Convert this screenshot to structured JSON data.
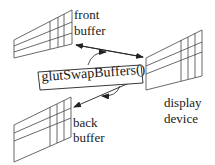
{
  "diagram": {
    "type": "double-buffering",
    "nodes": {
      "front_buffer": {
        "label_line1": "front",
        "label_line2": "buffer"
      },
      "back_buffer": {
        "label_line1": "back",
        "label_line2": "buffer"
      },
      "display_device": {
        "label_line1": "display",
        "label_line2": "device"
      }
    },
    "function_label": "glutSwapBuffers()",
    "edges": [
      {
        "from": "display_device",
        "to": "front_buffer",
        "bidirectional": true
      },
      {
        "from": "display_device",
        "to": "back_buffer",
        "bidirectional": true
      },
      {
        "from": "front_buffer",
        "to": "back_buffer",
        "kind": "circular-swap"
      }
    ],
    "colors": {
      "stroke": "#333333",
      "text": "#1a1a1a",
      "background": "#ffffff"
    }
  }
}
